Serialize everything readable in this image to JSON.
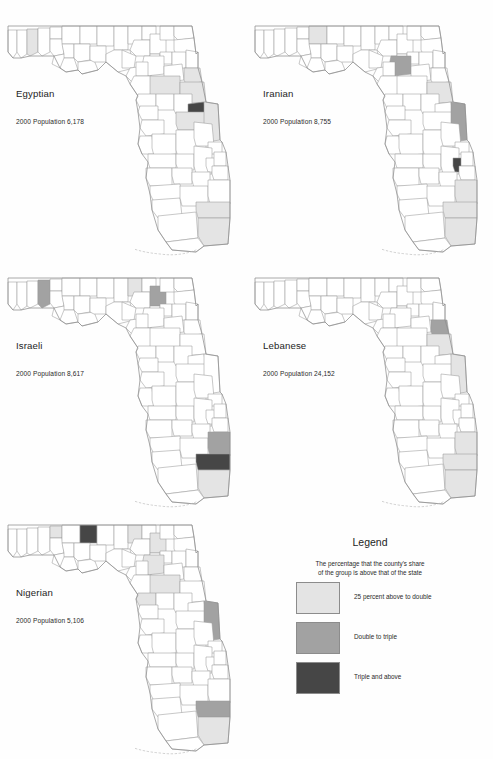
{
  "page": {
    "background": "#fefefe",
    "kind": "small-multiples-choropleth-map-sheet"
  },
  "colors": {
    "none": "#ffffff",
    "light": "#e4e4e4",
    "mid": "#a2a2a2",
    "dark": "#464646",
    "county_stroke": "#9a9a9a",
    "coast_stroke": "#8d8d8d"
  },
  "panels": [
    {
      "id": "egyptian",
      "title": "Egyptian",
      "population_label": "2000 Population 6,178"
    },
    {
      "id": "iranian",
      "title": "Iranian",
      "population_label": "2000 Population 8,755"
    },
    {
      "id": "israeli",
      "title": "Israeli",
      "population_label": "2000 Population 8,617"
    },
    {
      "id": "lebanese",
      "title": "Lebanese",
      "population_label": "2000 Population 24,152"
    },
    {
      "id": "nigerian",
      "title": "Nigerian",
      "population_label": "2000 Population 5,106"
    }
  ],
  "legend": {
    "title": "Legend",
    "subtitle_line1": "The percentage that the county's share",
    "subtitle_line2": "of the group is above that of the state",
    "items": [
      {
        "swatch": "#e4e4e4",
        "label": "25 percent above to double"
      },
      {
        "swatch": "#a2a2a2",
        "label": "Double to triple"
      },
      {
        "swatch": "#464646",
        "label": "Triple and above"
      }
    ]
  },
  "chart_data": {
    "type": "map",
    "subtype": "choropleth small multiples",
    "region": "Florida, by county",
    "title": "",
    "legend_position": "bottom-right",
    "classes": [
      {
        "name": "25 percent above to double",
        "color": "#e4e4e4"
      },
      {
        "name": "Double to triple",
        "color": "#a2a2a2"
      },
      {
        "name": "Triple and above",
        "color": "#464646"
      }
    ],
    "series": [
      {
        "name": "Egyptian",
        "population_2000": 6178,
        "shaded_counties": [
          {
            "county": "Okaloosa",
            "class": "light"
          },
          {
            "county": "Marion",
            "class": "light"
          },
          {
            "county": "Flagler",
            "class": "light"
          },
          {
            "county": "Volusia",
            "class": "light"
          },
          {
            "county": "Seminole",
            "class": "dark"
          },
          {
            "county": "Orange",
            "class": "light"
          },
          {
            "county": "Brevard",
            "class": "light"
          },
          {
            "county": "Broward",
            "class": "light"
          },
          {
            "county": "Miami-Dade",
            "class": "light"
          }
        ]
      },
      {
        "name": "Iranian",
        "population_2000": 8755,
        "shaded_counties": [
          {
            "county": "Jackson",
            "class": "light"
          },
          {
            "county": "Alachua",
            "class": "mid"
          },
          {
            "county": "Volusia",
            "class": "light"
          },
          {
            "county": "Brevard",
            "class": "mid"
          },
          {
            "county": "Okeechobee",
            "class": "dark"
          },
          {
            "county": "Palm Beach",
            "class": "light"
          },
          {
            "county": "Broward",
            "class": "light"
          },
          {
            "county": "Miami-Dade",
            "class": "light"
          }
        ]
      },
      {
        "name": "Israeli",
        "population_2000": 8617,
        "shaded_counties": [
          {
            "county": "Walton",
            "class": "mid"
          },
          {
            "county": "Madison",
            "class": "light"
          },
          {
            "county": "Columbia",
            "class": "mid"
          },
          {
            "county": "Palm Beach",
            "class": "mid"
          },
          {
            "county": "Broward",
            "class": "dark"
          },
          {
            "county": "Miami-Dade",
            "class": "light"
          }
        ]
      },
      {
        "name": "Lebanese",
        "population_2000": 24152,
        "shaded_counties": [
          {
            "county": "Flagler",
            "class": "mid"
          },
          {
            "county": "Volusia",
            "class": "light"
          },
          {
            "county": "Brevard",
            "class": "light"
          },
          {
            "county": "Palm Beach",
            "class": "light"
          },
          {
            "county": "Broward",
            "class": "light"
          },
          {
            "county": "Miami-Dade",
            "class": "light"
          }
        ]
      },
      {
        "name": "Nigerian",
        "population_2000": 5106,
        "shaded_counties": [
          {
            "county": "Holmes",
            "class": "light"
          },
          {
            "county": "Gadsden",
            "class": "dark"
          },
          {
            "county": "Madison",
            "class": "light"
          },
          {
            "county": "Columbia",
            "class": "light"
          },
          {
            "county": "Alachua",
            "class": "light"
          },
          {
            "county": "Marion",
            "class": "light"
          },
          {
            "county": "Citrus",
            "class": "light"
          },
          {
            "county": "Brevard",
            "class": "mid"
          },
          {
            "county": "Broward",
            "class": "mid"
          },
          {
            "county": "Miami-Dade",
            "class": "light"
          }
        ]
      }
    ]
  }
}
